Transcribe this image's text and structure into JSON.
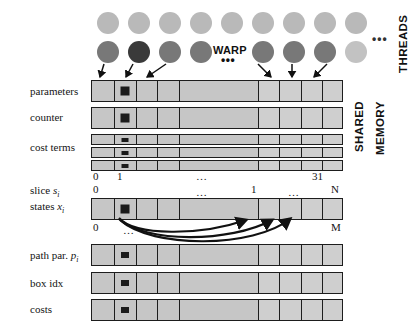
{
  "figure": {
    "vertical_labels": {
      "threads": "THREADS",
      "shared": "SHARED",
      "memory": "MEMORY"
    },
    "warp": {
      "label": "WARP",
      "dots": "•••"
    },
    "thread_rows_ellipsis": "•••"
  },
  "threads": {
    "row_top": [
      {
        "name": "thread-top-0",
        "shade": "c-light"
      },
      {
        "name": "thread-top-1",
        "shade": "c-light"
      },
      {
        "name": "thread-top-2",
        "shade": "c-light"
      },
      {
        "name": "thread-top-3",
        "shade": "c-light"
      },
      {
        "name": "thread-top-4",
        "shade": "c-light"
      },
      {
        "name": "thread-top-5",
        "shade": "c-light"
      },
      {
        "name": "thread-top-6",
        "shade": "c-light"
      },
      {
        "name": "thread-top-7",
        "shade": "c-light"
      },
      {
        "name": "thread-top-8",
        "shade": "c-light"
      }
    ],
    "row_warp": [
      {
        "name": "thread-warp-0",
        "shade": "c-mid"
      },
      {
        "name": "thread-warp-1",
        "shade": "c-dark"
      },
      {
        "name": "thread-warp-2",
        "shade": "c-mid"
      },
      {
        "name": "thread-warp-3",
        "shade": "c-mid"
      },
      {
        "name": "thread-warp-4",
        "shade": "c-mid"
      },
      {
        "name": "thread-warp-5",
        "shade": "c-mid"
      },
      {
        "name": "thread-warp-6",
        "shade": "c-mid"
      },
      {
        "name": "thread-warp-7",
        "shade": "c-faint"
      }
    ]
  },
  "rows": {
    "parameters": {
      "label": "parameters",
      "highlight_cell": 1,
      "cells": 9
    },
    "counter": {
      "label": "counter",
      "highlight_cell": 1,
      "cells": 9
    },
    "cost_terms": {
      "label": "cost terms",
      "highlight_cell": 1,
      "cells": 9,
      "stripes": 3
    },
    "slice": {
      "label_main": "slice",
      "label_var": "s",
      "label_sub": "i"
    },
    "states": {
      "label_main": "states",
      "label_var": "x",
      "label_sub": "i",
      "highlight_cell": 1,
      "cells": 9
    },
    "path_par": {
      "label_main": "path par.",
      "label_var": "p",
      "label_sub": "i",
      "highlight_cell": 1,
      "cells": 9
    },
    "box_idx": {
      "label": "box idx",
      "highlight_cell": 1,
      "cells": 9
    },
    "costs": {
      "label": "costs",
      "highlight_cell": 1,
      "cells": 9
    }
  },
  "axes": {
    "warp_index": {
      "start": "0",
      "second": "1",
      "middle_dots": "…",
      "end": "31"
    },
    "slice_axis": {
      "start": "0",
      "middle_dots": "…",
      "one": "1",
      "trailing_dots": "…",
      "end": "N"
    },
    "states_axis": {
      "start": "0",
      "dots": "…",
      "end": "M"
    }
  },
  "colors": {
    "bar_fill": "#c6c6c6",
    "bar_fill_light": "#cfcfcf",
    "stroke": "#1d1d1d",
    "circle_light": "#b9b9b9",
    "circle_mid": "#787878",
    "circle_dark": "#3a3a3a",
    "marker": "#1b1b1b"
  }
}
